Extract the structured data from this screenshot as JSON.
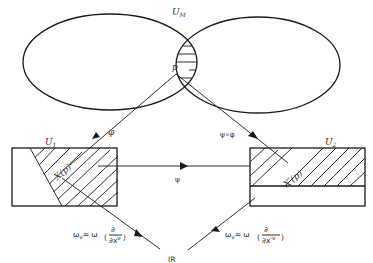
{
  "diagram": {
    "labels": {
      "manifold_set": "U",
      "manifold_set_sub": "M",
      "point": "p",
      "chart1_set": "U",
      "chart1_set_sub": "1",
      "chart2_set": "U",
      "chart2_set_sub": "2",
      "chart1_map": "φ",
      "chart2_map": "ψ∘φ",
      "transition_map": "ψ",
      "image1": "X(p)",
      "image2": "X′(p)",
      "target": "IR",
      "form1": "ω_ν = ω(∂/∂x^ν)",
      "form2": "ω′_ν = ω(∂/∂x′^ν)"
    },
    "form1_parts": {
      "lhs": "ω",
      "lhs_sub": "ν",
      "eq": "= ω",
      "num": "∂",
      "den": "∂x",
      "den_sup": "ν"
    },
    "form2_parts": {
      "lhs": "ω",
      "lhs_sub": "ν",
      "lhs_sup": "′",
      "eq": "= ω",
      "num": "∂",
      "den": "∂x′",
      "den_sup": "ν"
    },
    "colors": {
      "ink": "#1a1a1a",
      "background": "#ffffff"
    }
  }
}
